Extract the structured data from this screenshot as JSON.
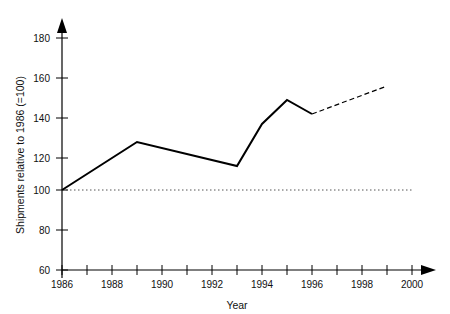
{
  "chart_data": {
    "type": "line",
    "title": "",
    "xlabel": "Year",
    "ylabel": "Shipments relative to 1986 (=100)",
    "xlim": [
      1986,
      2000
    ],
    "ylim": [
      60,
      185
    ],
    "grid": false,
    "legend": "none",
    "x_tick_labels": [
      "1986",
      "1988",
      "1990",
      "1992",
      "1994",
      "1996",
      "1998",
      "2000"
    ],
    "x_tick_values": [
      1986,
      1988,
      1990,
      1992,
      1994,
      1996,
      1998,
      2000
    ],
    "x_minor_ticks": [
      1987,
      1989,
      1991,
      1993,
      1995,
      1997,
      1999
    ],
    "y_tick_labels": [
      "60",
      "80",
      "100",
      "120",
      "140",
      "160",
      "180"
    ],
    "y_tick_values": [
      60,
      80,
      100,
      120,
      140,
      160,
      180
    ],
    "reference_line": {
      "name": "baseline-100",
      "value": 100,
      "style": "dotted",
      "x_start": 1986,
      "x_end": 2000
    },
    "series": [
      {
        "name": "Shipments (actual)",
        "style": "solid",
        "x": [
          1986,
          1989,
          1993,
          1994,
          1995,
          1996
        ],
        "values": [
          100,
          124,
          112,
          133,
          145,
          138
        ]
      },
      {
        "name": "Shipments (forecast)",
        "style": "dashed",
        "x": [
          1996,
          1999
        ],
        "values": [
          138,
          152
        ]
      }
    ],
    "annotations": []
  },
  "axes": {
    "y_axis_arrow": "up-arrow",
    "x_axis_arrow": "right-arrow"
  }
}
